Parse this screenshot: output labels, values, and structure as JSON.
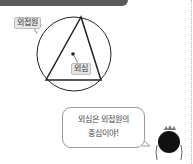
{
  "header": {
    "bar_color": "#5a5a5a"
  },
  "diagram": {
    "labels": {
      "circumcircle": "외접원",
      "circumcenter": "외심"
    },
    "stroke_color": "#222222",
    "label_bg": "#e6e6e6"
  },
  "speech": {
    "lines": [
      "외심은 외접원의",
      "중심이야!"
    ]
  },
  "character": {
    "name": "dark round character"
  }
}
